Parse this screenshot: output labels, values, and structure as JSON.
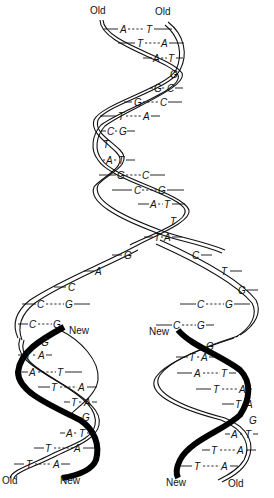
{
  "labels": {
    "top_left": "Old",
    "top_right": "Old",
    "fork_left_new": "New",
    "fork_right_new": "New",
    "bottom_left_old": "Old",
    "bottom_left_new": "New",
    "bottom_right_new": "New",
    "bottom_right_old": "Old"
  },
  "parent_helix": {
    "pairs": [
      {
        "l": "A",
        "r": "T"
      },
      {
        "l": "T",
        "r": "A"
      },
      {
        "l": "A",
        "r": "T"
      },
      {
        "l": "G",
        "r": ""
      },
      {
        "l": "G",
        "r": "C"
      },
      {
        "l": "G",
        "r": "C"
      },
      {
        "l": "T",
        "r": "A"
      },
      {
        "l": "C",
        "r": "G"
      },
      {
        "l": "T",
        "r": ""
      },
      {
        "l": "A",
        "r": "T"
      },
      {
        "l": "G",
        "r": "C"
      },
      {
        "l": "C",
        "r": "G"
      },
      {
        "l": "A",
        "r": "T"
      },
      {
        "l": "T",
        "r": ""
      },
      {
        "l": "T",
        "r": "A"
      }
    ]
  },
  "fork_left_unpaired": [
    "G",
    "A",
    "C"
  ],
  "fork_right_unpaired": [
    "C",
    "T",
    "G"
  ],
  "left_daughter": {
    "pairs": [
      {
        "l": "C",
        "r": "G"
      },
      {
        "l": "C",
        "r": "G"
      },
      {
        "l": "G",
        "r": ""
      },
      {
        "l": "T",
        "r": "A"
      },
      {
        "l": "A",
        "r": "T"
      },
      {
        "l": "T",
        "r": "A"
      },
      {
        "l": "T",
        "r": "A"
      },
      {
        "l": "G",
        "r": ""
      },
      {
        "l": "A",
        "r": "T"
      },
      {
        "l": "T",
        "r": "A"
      },
      {
        "l": "T",
        "r": "A"
      }
    ]
  },
  "right_daughter": {
    "pairs": [
      {
        "l": "C",
        "r": "G"
      },
      {
        "l": "C",
        "r": "G"
      },
      {
        "l": "G",
        "r": ""
      },
      {
        "l": "T",
        "r": "A"
      },
      {
        "l": "A",
        "r": "T"
      },
      {
        "l": "T",
        "r": "A"
      },
      {
        "l": "T",
        "r": "A"
      },
      {
        "l": "G",
        "r": ""
      },
      {
        "l": "A",
        "r": "T"
      },
      {
        "l": "T",
        "r": "A"
      },
      {
        "l": "T",
        "r": "A"
      }
    ]
  }
}
